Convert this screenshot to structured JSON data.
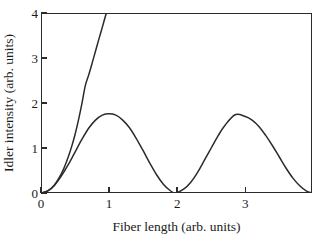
{
  "chart_data": {
    "type": "line",
    "title": "",
    "xlabel": "Fiber length (arb. units)",
    "ylabel": "Idler intensity (arb. units)",
    "xlim": [
      0,
      3.98
    ],
    "ylim": [
      0,
      4
    ],
    "xticks": [
      0,
      1,
      2,
      3
    ],
    "xticklabels": [
      "0",
      "1",
      "2",
      "3"
    ],
    "yticks": [
      0,
      1,
      2,
      3,
      4
    ],
    "yticklabels": [
      "0",
      "1",
      "2",
      "3",
      "4"
    ],
    "grid": false,
    "legend": null,
    "series": [
      {
        "name": "phase-matched (exponential gain)",
        "description": "monotonically rising curve, sinh-squared like, clipped at top of axes",
        "color": "#2b2b2b",
        "x": [
          0.0,
          0.1,
          0.2,
          0.3,
          0.35,
          0.4,
          0.45,
          0.5,
          0.55,
          0.6,
          0.65,
          0.7,
          0.75,
          0.8,
          0.85,
          0.9,
          0.95,
          0.96
        ],
        "y": [
          0.0,
          0.045,
          0.185,
          0.43,
          0.6,
          0.8,
          1.03,
          1.3,
          1.62,
          1.98,
          2.38,
          2.62,
          2.88,
          3.15,
          3.42,
          3.68,
          3.95,
          4.0
        ]
      },
      {
        "name": "phase-mismatched (oscillatory)",
        "description": "sine-squared like oscillation with two lobes",
        "color": "#2b2b2b",
        "peaks": [
          {
            "x": 1.0,
            "y": 1.76
          },
          {
            "x": 2.85,
            "y": 1.74
          }
        ],
        "zeros": [
          0.0,
          1.97,
          3.98
        ],
        "x": [
          0.0,
          0.1,
          0.2,
          0.3,
          0.4,
          0.5,
          0.6,
          0.7,
          0.8,
          0.9,
          1.0,
          1.1,
          1.2,
          1.3,
          1.4,
          1.5,
          1.6,
          1.7,
          1.8,
          1.9,
          1.97,
          2.1,
          2.2,
          2.3,
          2.4,
          2.5,
          2.6,
          2.7,
          2.85,
          3.0,
          3.1,
          3.2,
          3.3,
          3.4,
          3.5,
          3.6,
          3.7,
          3.8,
          3.9,
          3.98
        ],
        "y": [
          0.0,
          0.045,
          0.175,
          0.38,
          0.63,
          0.91,
          1.19,
          1.44,
          1.62,
          1.73,
          1.76,
          1.73,
          1.62,
          1.45,
          1.21,
          0.94,
          0.66,
          0.4,
          0.19,
          0.05,
          0.0,
          0.09,
          0.24,
          0.46,
          0.73,
          1.0,
          1.27,
          1.5,
          1.74,
          1.7,
          1.62,
          1.48,
          1.28,
          1.05,
          0.8,
          0.55,
          0.33,
          0.16,
          0.04,
          0.0
        ]
      }
    ]
  },
  "axis": {
    "x_title": "Fiber length (arb. units)",
    "y_title": "Idler intensity (arb. units)"
  },
  "colors": {
    "curve": "#2b2b2b",
    "frame": "#2b2b2b",
    "background": "#ffffff",
    "text": "#1a1a1a"
  }
}
